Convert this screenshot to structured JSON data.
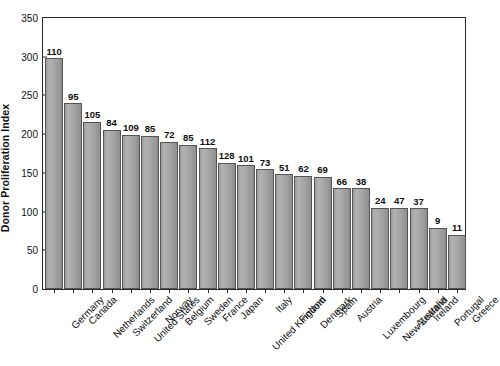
{
  "chart_data": {
    "type": "bar",
    "title": "",
    "xlabel": "",
    "ylabel": "Donor Proliferation Index",
    "ylim": [
      0,
      350
    ],
    "ytick_values": [
      0,
      50,
      100,
      150,
      200,
      250,
      300,
      350
    ],
    "ytick_labels": [
      "0",
      "50",
      "100",
      "150",
      "200",
      "250",
      "300",
      "350"
    ],
    "grid": false,
    "legend": null,
    "bar_color": "#a6a6a6",
    "bar_edge_color": "#555555",
    "categories": [
      "Germany",
      "Canada",
      "Netherlands",
      "Switzerland",
      "United States",
      "Norway",
      "Belgium",
      "Sweden",
      "France",
      "Japan",
      "United Kingdom",
      "Italy",
      "Finland",
      "Denmark",
      "Spain",
      "Austria",
      "Luxembourg",
      "New Zealand",
      "Australia",
      "Ireland",
      "Portugal",
      "Greece"
    ],
    "values": [
      298,
      240,
      216,
      206,
      199,
      198,
      190,
      186,
      182,
      163,
      160,
      155,
      148,
      146,
      145,
      130,
      130,
      105,
      105,
      104,
      79,
      70
    ],
    "point_labels": [
      "110",
      "95",
      "105",
      "84",
      "109",
      "85",
      "72",
      "85",
      "112",
      "128",
      "101",
      "73",
      "51",
      "62",
      "69",
      "66",
      "38",
      "24",
      "47",
      "37",
      "9",
      "11"
    ]
  }
}
